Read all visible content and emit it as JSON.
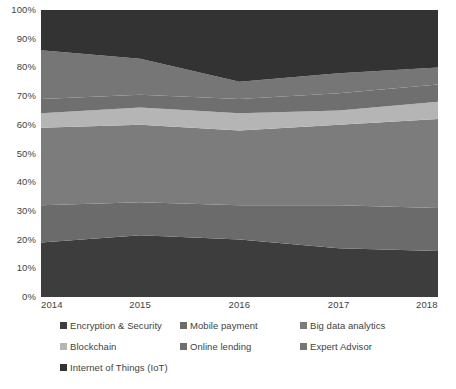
{
  "chart_data": {
    "type": "area",
    "stacked": true,
    "normalized": true,
    "title": "",
    "xlabel": "",
    "ylabel": "",
    "x": [
      2014,
      2015,
      2016,
      2017,
      2018
    ],
    "xtick_labels": [
      "2014",
      "2015",
      "2016",
      "2017",
      "2018"
    ],
    "ytick_labels": [
      "0%",
      "10%",
      "20%",
      "30%",
      "40%",
      "50%",
      "60%",
      "70%",
      "80%",
      "90%",
      "100%"
    ],
    "ytick_values": [
      0,
      10,
      20,
      30,
      40,
      50,
      60,
      70,
      80,
      90,
      100
    ],
    "ylim": [
      0,
      100
    ],
    "xlim": [
      2014,
      2018
    ],
    "grid": false,
    "legend_position": "bottom",
    "series": [
      {
        "name": "Encryption & Security",
        "color": "#3d3d3d",
        "values": [
          19,
          21.5,
          20,
          17,
          16
        ]
      },
      {
        "name": "Mobile payment",
        "color": "#6b6b6b",
        "values": [
          13,
          11.5,
          12,
          15,
          15
        ]
      },
      {
        "name": "Big data analytics",
        "color": "#7c7c7c",
        "values": [
          27,
          27,
          26,
          28,
          31
        ]
      },
      {
        "name": "Blockchain",
        "color": "#b5b5b5",
        "values": [
          5,
          6,
          6,
          5,
          6
        ]
      },
      {
        "name": "Online lending",
        "color": "#6f6f6f",
        "values": [
          5,
          4.5,
          5,
          6,
          6
        ]
      },
      {
        "name": "Expert Advisor",
        "color": "#767676",
        "values": [
          17,
          12.5,
          6,
          7,
          6
        ]
      },
      {
        "name": "Internet of Things (IoT)",
        "color": "#333333",
        "values": [
          14,
          17,
          25,
          22,
          20
        ]
      }
    ],
    "boundaries_percent": {
      "note": "cumulative upper edge of each band, bottom-to-top, per year",
      "2014": [
        19,
        32,
        59,
        64,
        69,
        86,
        100
      ],
      "2015": [
        21.5,
        33,
        60,
        66,
        70.5,
        78,
        100
      ],
      "2016": [
        20,
        32,
        58,
        64,
        69,
        75,
        100
      ],
      "2017": [
        17,
        32,
        60,
        65,
        71,
        78,
        100
      ],
      "2018": [
        16,
        31,
        62,
        68,
        74,
        80,
        100
      ]
    }
  },
  "legend": {
    "items": [
      {
        "label": "Encryption & Security",
        "color": "#3d3d3d"
      },
      {
        "label": "Mobile payment",
        "color": "#6b6b6b"
      },
      {
        "label": "Big data analytics",
        "color": "#7c7c7c"
      },
      {
        "label": "Blockchain",
        "color": "#b5b5b5"
      },
      {
        "label": "Online lending",
        "color": "#6f6f6f"
      },
      {
        "label": "Expert Advisor",
        "color": "#767676"
      },
      {
        "label": "Internet of Things (IoT)",
        "color": "#333333"
      }
    ]
  },
  "colors": {
    "background": "#ffffff",
    "text": "#3f3f3f"
  }
}
